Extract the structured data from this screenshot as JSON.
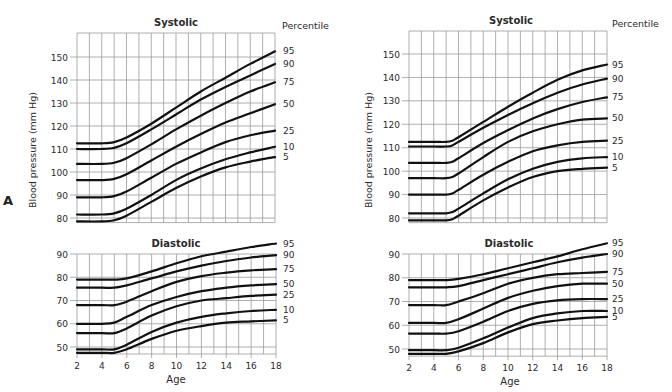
{
  "figure": {
    "panel_label": "A",
    "percentile_header": "Percentile",
    "ylabel": "Blood pressure (mm Hg)",
    "xlabel": "Age"
  },
  "chart_data": [
    {
      "type": "line",
      "panel": "left",
      "title": "Systolic",
      "xlabel": "",
      "ylabel": "Blood pressure (mm Hg)",
      "xlim": [
        2,
        18
      ],
      "ylim": [
        78,
        160
      ],
      "yticks": [
        80,
        90,
        100,
        110,
        120,
        130,
        140,
        150
      ],
      "grid": true,
      "legend_position": "right (end-of-line labels)",
      "x": [
        2,
        4,
        5,
        6,
        8,
        10,
        12,
        14,
        16,
        18
      ],
      "series": [
        {
          "name": "95",
          "values": [
            112.5,
            112.5,
            113,
            115,
            121,
            128,
            135,
            141,
            147,
            152.5
          ]
        },
        {
          "name": "90",
          "values": [
            110,
            110,
            110.5,
            112.5,
            118.5,
            125,
            131.5,
            137,
            142,
            147
          ]
        },
        {
          "name": "75",
          "values": [
            103.5,
            103.5,
            104,
            106,
            112,
            118.5,
            124.5,
            130,
            135,
            139
          ]
        },
        {
          "name": "50",
          "values": [
            96.5,
            96.5,
            97,
            99,
            105,
            111,
            116.5,
            121.5,
            125.5,
            129.5
          ]
        },
        {
          "name": "25",
          "values": [
            89,
            89,
            89.5,
            91.5,
            97.5,
            103.5,
            108.5,
            113,
            116,
            118
          ]
        },
        {
          "name": "10",
          "values": [
            81.5,
            81.5,
            82,
            84,
            90,
            96.5,
            101.5,
            105.5,
            108.5,
            111
          ]
        },
        {
          "name": "5",
          "values": [
            78.5,
            78.5,
            79,
            81,
            87,
            93,
            98,
            102,
            104.5,
            106.5
          ]
        }
      ]
    },
    {
      "type": "line",
      "panel": "left",
      "title": "Diastolic",
      "xlabel": "Age",
      "ylabel": "Blood pressure (mm Hg)",
      "xlim": [
        2,
        18
      ],
      "ylim": [
        47,
        90
      ],
      "yticks": [
        50,
        60,
        70,
        80,
        90
      ],
      "xticks": [
        2,
        4,
        6,
        8,
        10,
        12,
        14,
        16,
        18
      ],
      "grid": true,
      "x": [
        2,
        4,
        5,
        6,
        8,
        10,
        12,
        14,
        16,
        18
      ],
      "series": [
        {
          "name": "95",
          "values": [
            79,
            79,
            79,
            79.5,
            82.5,
            86,
            89,
            91,
            93,
            94.5
          ]
        },
        {
          "name": "90",
          "values": [
            75.5,
            75.5,
            75.5,
            76.5,
            79.5,
            82.5,
            85,
            87,
            88.5,
            89.5
          ]
        },
        {
          "name": "75",
          "values": [
            68,
            68,
            68,
            69.5,
            74,
            78,
            80.5,
            82,
            83,
            83.5
          ]
        },
        {
          "name": "50",
          "values": [
            60,
            60,
            60.5,
            63,
            68,
            71.5,
            74,
            75.5,
            76.5,
            77
          ]
        },
        {
          "name": "25",
          "values": [
            56,
            56,
            56,
            58,
            63.5,
            67.5,
            70,
            71,
            72,
            72.5
          ]
        },
        {
          "name": "10",
          "values": [
            49,
            49,
            49,
            51,
            56.5,
            60.5,
            63,
            64.5,
            65.5,
            66
          ]
        },
        {
          "name": "5",
          "values": [
            47.5,
            47.5,
            47.5,
            49,
            53.5,
            57,
            59,
            60.5,
            61,
            61.5
          ]
        }
      ]
    },
    {
      "type": "line",
      "panel": "right",
      "title": "Systolic",
      "xlabel": "",
      "ylabel": "Blood pressure (mm Hg)",
      "xlim": [
        2,
        18
      ],
      "ylim": [
        78,
        160
      ],
      "yticks": [
        80,
        90,
        100,
        110,
        120,
        130,
        140,
        150
      ],
      "grid": true,
      "legend_position": "right (end-of-line labels)",
      "x": [
        2,
        4,
        5,
        5.5,
        6,
        8,
        10,
        12,
        14,
        16,
        18
      ],
      "series": [
        {
          "name": "95",
          "values": [
            112.5,
            112.5,
            112.5,
            113,
            114.5,
            121,
            127.5,
            133.5,
            139,
            143,
            145.5
          ]
        },
        {
          "name": "90",
          "values": [
            110.5,
            110.5,
            110.5,
            111,
            112.5,
            118.5,
            124,
            129,
            133.5,
            137,
            139.5
          ]
        },
        {
          "name": "75",
          "values": [
            103.5,
            103.5,
            103.5,
            104,
            105.5,
            112,
            117.5,
            122.5,
            126.5,
            129.5,
            131.5
          ]
        },
        {
          "name": "50",
          "values": [
            97,
            97,
            97,
            97.5,
            99,
            106,
            112.5,
            117,
            120,
            122,
            122.5
          ]
        },
        {
          "name": "25",
          "values": [
            90,
            90,
            90,
            90.5,
            92,
            98.5,
            104,
            108.5,
            111,
            112.5,
            113
          ]
        },
        {
          "name": "10",
          "values": [
            82,
            82,
            82,
            82.5,
            84,
            90.5,
            96.5,
            101,
            104,
            105.5,
            106
          ]
        },
        {
          "name": "5",
          "values": [
            79,
            79,
            79,
            79.5,
            81,
            87.5,
            93,
            97.5,
            100,
            101,
            101.5
          ]
        }
      ]
    },
    {
      "type": "line",
      "panel": "right",
      "title": "Diastolic",
      "xlabel": "Age",
      "ylabel": "Blood pressure (mm Hg)",
      "xlim": [
        2,
        18
      ],
      "ylim": [
        47,
        90
      ],
      "yticks": [
        50,
        60,
        70,
        80,
        90
      ],
      "xticks": [
        2,
        4,
        6,
        8,
        10,
        12,
        14,
        16,
        18
      ],
      "grid": true,
      "x": [
        2,
        4,
        5,
        6,
        8,
        10,
        12,
        14,
        16,
        18
      ],
      "series": [
        {
          "name": "95",
          "values": [
            79,
            79,
            79,
            79.5,
            81.5,
            84,
            86.5,
            89,
            92,
            94.5
          ]
        },
        {
          "name": "90",
          "values": [
            76,
            76,
            76,
            76.5,
            79,
            81.5,
            84,
            86.5,
            88.5,
            90
          ]
        },
        {
          "name": "75",
          "values": [
            68.5,
            68.5,
            68.5,
            70,
            73.5,
            77.5,
            80,
            81.5,
            82,
            82.5
          ]
        },
        {
          "name": "50",
          "values": [
            61,
            61,
            61,
            62.5,
            67,
            71.5,
            74.5,
            76.5,
            77.5,
            77.5
          ]
        },
        {
          "name": "25",
          "values": [
            56.5,
            56.5,
            56.5,
            57.5,
            61.5,
            66,
            69,
            70.5,
            71,
            71
          ]
        },
        {
          "name": "10",
          "values": [
            49.5,
            49.5,
            49.5,
            50.5,
            54.5,
            59,
            63,
            65,
            66,
            66
          ]
        },
        {
          "name": "5",
          "values": [
            48,
            48,
            48,
            49,
            52.5,
            57,
            60.5,
            62,
            63,
            63.5
          ]
        }
      ]
    }
  ],
  "layout": {
    "panels": [
      {
        "systolic": {
          "x0": 77,
          "x1": 275,
          "y_top": 33,
          "y_at_150": 57,
          "y_at_80": 218,
          "bottom_val": 78,
          "top_val": 160
        },
        "diastolic": {
          "x0": 77,
          "x1": 276,
          "y_top": 254,
          "y_at_90": 254,
          "y_at_50": 347,
          "bottom_val": 47
        },
        "title_systolic_x": 176,
        "title_diastolic_x": 176,
        "percentile_x": 282,
        "labels_x": 283,
        "ylabel_x": 36,
        "age_x": 176
      },
      {
        "systolic": {
          "x0": 409,
          "x1": 607,
          "y_top": 31,
          "y_at_150": 54,
          "y_at_80": 218,
          "bottom_val": 78,
          "top_val": 160
        },
        "diastolic": {
          "x0": 409,
          "x1": 607,
          "y_top": 254,
          "y_at_90": 254,
          "y_at_50": 349,
          "bottom_val": 47
        },
        "title_systolic_x": 511,
        "title_diastolic_x": 509,
        "percentile_x": 612,
        "labels_x": 612,
        "ylabel_x": 372,
        "age_x": 510
      }
    ],
    "line_color": "#111111",
    "grid_color": "#9a9a9a"
  }
}
